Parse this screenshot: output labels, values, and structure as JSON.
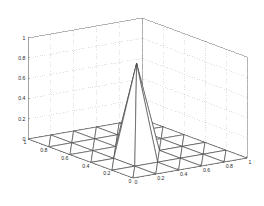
{
  "figure": {
    "background_color": "#ffffff",
    "axis_line_color": "#808080",
    "grid_line_color": "#b8b8b8",
    "mesh_line_color": "#404040",
    "mesh_face_color": "#ffffff",
    "tick_label_color": "#2a2a2a",
    "width": 264,
    "height": 206
  },
  "chart_data": {
    "type": "surface",
    "title": "",
    "xlabel": "",
    "ylabel": "",
    "zlabel": "",
    "projection": "3d",
    "mesh_style": "triangulated-wireframe",
    "grid": true,
    "legend": null,
    "xlim": [
      0,
      1
    ],
    "ylim": [
      0,
      1
    ],
    "zlim": [
      0,
      1
    ],
    "x_ticks": [
      0,
      0.2,
      0.4,
      0.6,
      0.8,
      1
    ],
    "y_ticks": [
      0,
      0.2,
      0.4,
      0.6,
      0.8,
      1
    ],
    "z_ticks": [
      0,
      0.2,
      0.4,
      0.6,
      0.8,
      1
    ],
    "x_tick_labels": [
      "0",
      "0.2",
      "0.4",
      "0.6",
      "0.8",
      "1"
    ],
    "y_tick_labels": [
      "1",
      "0.8",
      "0.6",
      "0.4",
      "0.2",
      "0"
    ],
    "z_tick_labels": [
      "0",
      "0.2",
      "0.4",
      "0.6",
      "0.8",
      "1"
    ],
    "grid_nx": 5,
    "grid_ny": 5,
    "peak": {
      "x": 0.4,
      "y": 0.4,
      "z": 0.9
    },
    "baseline_z": 0,
    "z_values": [
      [
        0,
        0,
        0,
        0,
        0,
        0
      ],
      [
        0,
        0,
        0,
        0,
        0,
        0
      ],
      [
        0,
        0,
        0.9,
        0,
        0,
        0
      ],
      [
        0,
        0,
        0,
        0,
        0,
        0
      ],
      [
        0,
        0,
        0,
        0,
        0,
        0
      ],
      [
        0,
        0,
        0,
        0,
        0,
        0
      ]
    ],
    "view": {
      "azimuth": -37.5,
      "elevation": 30
    }
  }
}
